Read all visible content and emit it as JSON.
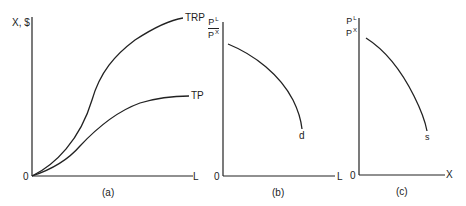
{
  "figure": {
    "panels": [
      {
        "id": "a",
        "caption": "(a)",
        "y_axis_label": "X, $",
        "x_axis_label": "L",
        "origin_label": "0",
        "curves": [
          {
            "name": "TRP",
            "label": "TRP",
            "shape": "S-shaped, rising steeply then flattening"
          },
          {
            "name": "TP",
            "label": "TP",
            "shape": "S-shaped, lower than TRP"
          }
        ]
      },
      {
        "id": "b",
        "caption": "(b)",
        "y_axis_label": {
          "numerator": "P",
          "numerator_sup": "L",
          "denominator": "P",
          "denominator_sup": "X"
        },
        "x_axis_label": "L",
        "origin_label": "0",
        "curves": [
          {
            "name": "d",
            "label": "d",
            "shape": "concave, downward sloping"
          }
        ]
      },
      {
        "id": "c",
        "caption": "(c)",
        "y_axis_label": {
          "numerator": "P",
          "numerator_sup": "L",
          "denominator": "P",
          "denominator_sup": "X"
        },
        "x_axis_label": "X",
        "origin_label": "0",
        "curves": [
          {
            "name": "s",
            "label": "s",
            "shape": "concave, downward sloping"
          }
        ]
      }
    ],
    "colors": {
      "ink": "#222222",
      "background": "#ffffff"
    }
  }
}
